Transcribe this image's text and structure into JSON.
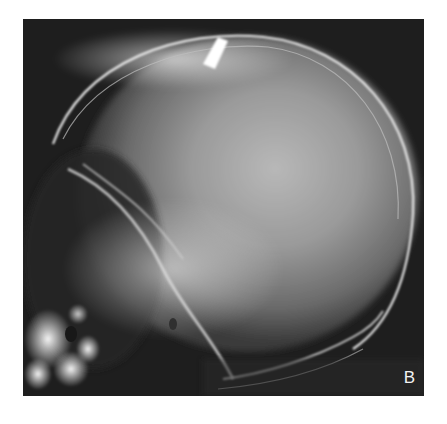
{
  "figure": {
    "panel_label": "B",
    "alt": "Lateral skull radiograph",
    "colors": {
      "background": "#ffffff",
      "film_dark": "#1c1c1c",
      "bone_bright": "#f0f0f0",
      "label": "#f2f2f2"
    }
  }
}
